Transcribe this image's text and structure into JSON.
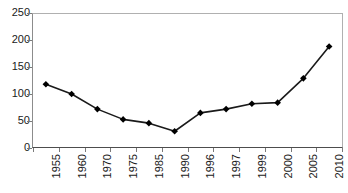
{
  "chart_data": {
    "type": "line",
    "title": "",
    "subtitle": "",
    "xlabel": "",
    "ylabel": "",
    "categories": [
      "1955",
      "1960",
      "1970",
      "1975",
      "1985",
      "1990",
      "1996",
      "1997",
      "1999",
      "2000",
      "2005",
      "2010"
    ],
    "values": [
      118,
      100,
      72,
      53,
      46,
      31,
      65,
      72,
      82,
      84,
      129,
      188
    ],
    "series": [
      {
        "name": "Series 1",
        "values": [
          118,
          100,
          72,
          53,
          46,
          31,
          65,
          72,
          82,
          84,
          129,
          188
        ]
      }
    ],
    "ylim": [
      0,
      250
    ],
    "y_ticks": [
      0,
      50,
      100,
      150,
      200,
      250
    ],
    "y_tick_labels": [
      "0",
      "50",
      "100",
      "150",
      "200",
      "250"
    ],
    "grid": false,
    "legend": false,
    "legend_position": "none",
    "annotations": [],
    "marker": "diamond",
    "line_color": "#1a1a1a",
    "marker_color": "#000000",
    "plot_background": "#ffffff",
    "axis_color": "#7a7a7a",
    "frame_color": "#b0b0b0",
    "x_label_rotation": -90
  }
}
